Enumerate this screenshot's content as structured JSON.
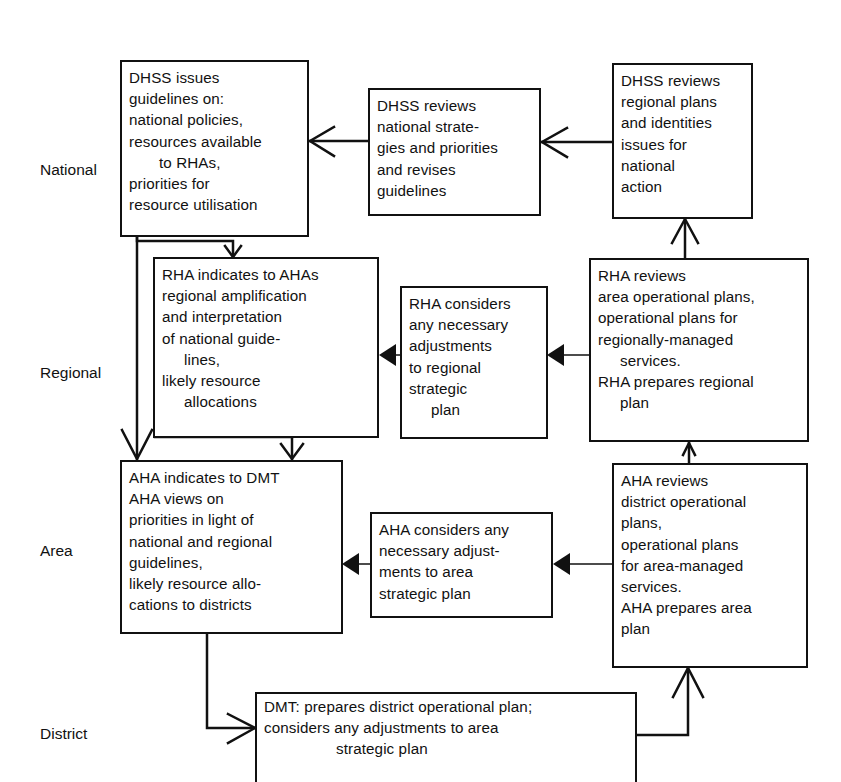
{
  "diagram": {
    "type": "planning-flowchart",
    "levels": [
      {
        "id": "national",
        "label": "National"
      },
      {
        "id": "regional",
        "label": "Regional"
      },
      {
        "id": "area",
        "label": "Area"
      },
      {
        "id": "district",
        "label": "District"
      }
    ],
    "nodes": {
      "dhss_issues": {
        "level": "national",
        "lines": [
          "DHSS issues",
          "guidelines on:",
          "national policies,",
          "resources available",
          "to RHAs,",
          "priorities for",
          "resource utilisation"
        ]
      },
      "dhss_reviews_national": {
        "level": "national",
        "lines": [
          "DHSS reviews",
          "national strate-",
          "gies and priorities",
          "and revises",
          "guidelines"
        ]
      },
      "dhss_reviews_regional": {
        "level": "national",
        "lines": [
          "DHSS reviews",
          "regional plans",
          "and identities",
          "issues for",
          "national",
          "action"
        ]
      },
      "rha_indicates": {
        "level": "regional",
        "lines": [
          "RHA indicates to AHAs",
          "regional amplification",
          "and interpretation",
          "of national guide-",
          "lines,",
          "likely resource",
          "allocations"
        ]
      },
      "rha_considers": {
        "level": "regional",
        "lines": [
          "RHA considers",
          "any necessary",
          "adjustments",
          "to regional",
          "strategic",
          "plan"
        ]
      },
      "rha_reviews": {
        "level": "regional",
        "lines": [
          "RHA reviews",
          "area operational plans,",
          "operational plans for",
          "regionally-managed",
          "services.",
          "RHA prepares regional",
          "plan"
        ]
      },
      "aha_indicates": {
        "level": "area",
        "lines": [
          "AHA indicates to DMT",
          "AHA views on",
          "priorities in light of",
          "national and regional",
          "guidelines,",
          "likely resource allo-",
          "cations to districts"
        ]
      },
      "aha_considers": {
        "level": "area",
        "lines": [
          "AHA considers any",
          "necessary adjust-",
          "ments to area",
          "strategic plan"
        ]
      },
      "aha_reviews": {
        "level": "area",
        "lines": [
          "AHA reviews",
          "district operational",
          "plans,",
          "operational plans",
          "for area-managed",
          "services.",
          "AHA prepares area",
          "plan"
        ]
      },
      "dmt_prepares": {
        "level": "district",
        "lines": [
          "DMT: prepares district operational plan;",
          "considers any adjustments to area",
          "strategic plan"
        ]
      }
    },
    "edges": [
      {
        "from": "dhss_reviews_regional",
        "to": "dhss_reviews_national",
        "arrow": "open"
      },
      {
        "from": "dhss_reviews_national",
        "to": "dhss_issues",
        "arrow": "open"
      },
      {
        "from": "dhss_issues",
        "to": "rha_indicates",
        "arrow": "open"
      },
      {
        "from": "dhss_issues",
        "to": "aha_indicates",
        "arrow": "open"
      },
      {
        "from": "rha_indicates",
        "to": "aha_indicates",
        "arrow": "open"
      },
      {
        "from": "rha_reviews",
        "to": "rha_considers",
        "arrow": "filled"
      },
      {
        "from": "rha_considers",
        "to": "rha_indicates",
        "arrow": "filled"
      },
      {
        "from": "rha_reviews",
        "to": "dhss_reviews_regional",
        "arrow": "open"
      },
      {
        "from": "aha_reviews",
        "to": "aha_considers",
        "arrow": "filled"
      },
      {
        "from": "aha_considers",
        "to": "aha_indicates",
        "arrow": "filled"
      },
      {
        "from": "aha_reviews",
        "to": "rha_reviews",
        "arrow": "open"
      },
      {
        "from": "aha_indicates",
        "to": "dmt_prepares",
        "arrow": "open"
      },
      {
        "from": "dmt_prepares",
        "to": "aha_reviews",
        "arrow": "open"
      }
    ],
    "colors": {
      "ink": "#111111",
      "background": "#ffffff"
    }
  }
}
